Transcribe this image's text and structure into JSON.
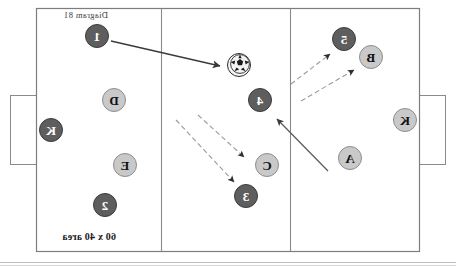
{
  "diagram": {
    "title": "Diagram 81",
    "area_label": "60 x 40 area",
    "mirrored": true,
    "canvas": {
      "width": 456,
      "height": 266
    },
    "colors": {
      "field_line": "#808080",
      "field_background": "#ffffff",
      "light_team_fill": "#c9c9c9",
      "light_team_text": "#121212",
      "dark_team_fill": "#5e5e5e",
      "dark_team_text": "#ffffff",
      "solid_arrow": "#3a3a3a",
      "dashed_arrow": "#9a9a9a"
    },
    "field": {
      "x": 36,
      "y": 8,
      "width": 384,
      "height": 244,
      "zone_lines_x": [
        165,
        294
      ],
      "goals": [
        {
          "side": "left",
          "x": 10,
          "y": 95,
          "width": 27,
          "height": 70
        },
        {
          "side": "right",
          "x": 419,
          "y": 95,
          "width": 27,
          "height": 70
        }
      ]
    },
    "players": [
      {
        "id": "p-5",
        "label": "5",
        "team": "dark",
        "cx": 112,
        "cy": 39,
        "r": 12
      },
      {
        "id": "p-B",
        "label": "B",
        "team": "light",
        "cx": 85,
        "cy": 57,
        "r": 12
      },
      {
        "id": "p-K-left",
        "label": "K",
        "team": "light",
        "cx": 51,
        "cy": 120,
        "r": 12
      },
      {
        "id": "p-A",
        "label": "A",
        "team": "light",
        "cx": 106,
        "cy": 158,
        "r": 12
      },
      {
        "id": "p-4",
        "label": "4",
        "team": "dark",
        "cx": 196,
        "cy": 100,
        "r": 12
      },
      {
        "id": "p-C",
        "label": "C",
        "team": "light",
        "cx": 189,
        "cy": 165,
        "r": 12
      },
      {
        "id": "p-3",
        "label": "3",
        "team": "dark",
        "cx": 210,
        "cy": 196,
        "r": 12
      },
      {
        "id": "p-1",
        "label": "1",
        "team": "dark",
        "cx": 359,
        "cy": 36,
        "r": 12
      },
      {
        "id": "p-D",
        "label": "D",
        "team": "light",
        "cx": 342,
        "cy": 100,
        "r": 12
      },
      {
        "id": "p-K-right",
        "label": "K",
        "team": "dark",
        "cx": 405,
        "cy": 130,
        "r": 12
      },
      {
        "id": "p-E",
        "label": "E",
        "team": "light",
        "cx": 331,
        "cy": 165,
        "r": 12
      },
      {
        "id": "p-2",
        "label": "2",
        "team": "dark",
        "cx": 351,
        "cy": 205,
        "r": 12
      }
    ],
    "ball": {
      "id": "ball",
      "cx": 216,
      "cy": 64,
      "r": 11
    },
    "arrows": [
      {
        "id": "pass-1-to-ball",
        "style": "solid",
        "x1": 345,
        "y1": 41,
        "x2": 236,
        "y2": 66
      },
      {
        "id": "run-A-to-4",
        "style": "solid",
        "x1": 128,
        "y1": 171,
        "x2": 179,
        "y2": 119
      },
      {
        "id": "run-B-dashed",
        "style": "dashed",
        "x1": 155,
        "y1": 101,
        "x2": 102,
        "y2": 70
      },
      {
        "id": "run-5-dashed",
        "style": "dashed",
        "x1": 165,
        "y1": 84,
        "x2": 126,
        "y2": 54
      },
      {
        "id": "run-C-dashed",
        "style": "dashed",
        "x1": 258,
        "y1": 115,
        "x2": 212,
        "y2": 157
      },
      {
        "id": "run-3-dashed",
        "style": "dashed",
        "x1": 280,
        "y1": 120,
        "x2": 222,
        "y2": 182
      }
    ]
  }
}
